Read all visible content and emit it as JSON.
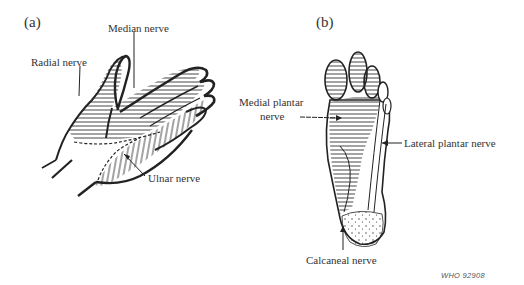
{
  "panels": [
    {
      "id": "a",
      "label": "(a)",
      "subject": "hand",
      "annotations": [
        {
          "text": "Median nerve"
        },
        {
          "text": "Radial nerve"
        },
        {
          "text": "Ulnar nerve"
        }
      ]
    },
    {
      "id": "b",
      "label": "(b)",
      "subject": "foot",
      "annotations": [
        {
          "text": "Medial plantar",
          "text2": "nerve"
        },
        {
          "text": "Lateral plantar nerve"
        },
        {
          "text": "Calcaneal nerve"
        }
      ]
    }
  ],
  "credit": "WHO 92908",
  "colors": {
    "ink": "#2a2a2a",
    "background": "#ffffff"
  }
}
